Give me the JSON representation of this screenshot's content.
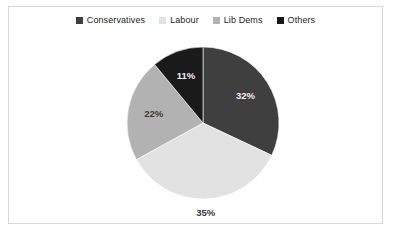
{
  "chart_data": {
    "type": "pie",
    "title": "",
    "categories": [
      "Conservatives",
      "Labour",
      "Lib Dems",
      "Others"
    ],
    "values": [
      32,
      35,
      22,
      11
    ],
    "value_labels": [
      "32%",
      "35%",
      "22%",
      "11%"
    ],
    "colors": [
      "#3f3f3f",
      "#e2e2e2",
      "#b2b2b2",
      "#1a1a1a"
    ],
    "legend_position": "top",
    "grid": false,
    "xlabel": "",
    "ylabel": "",
    "units": "percent",
    "start_angle_deg": 0,
    "direction": "clockwise"
  },
  "legend": {
    "items": [
      {
        "label": "Conservatives",
        "color": "#3f3f3f",
        "swatch_icon": "square-swatch-icon"
      },
      {
        "label": "Labour",
        "color": "#e2e2e2",
        "swatch_icon": "square-swatch-icon"
      },
      {
        "label": "Lib Dems",
        "color": "#b2b2b2",
        "swatch_icon": "square-swatch-icon"
      },
      {
        "label": "Others",
        "color": "#1a1a1a",
        "swatch_icon": "square-swatch-icon"
      }
    ]
  },
  "frame": {
    "border_color": "#d8d8d8",
    "background_color": "#ffffff"
  }
}
